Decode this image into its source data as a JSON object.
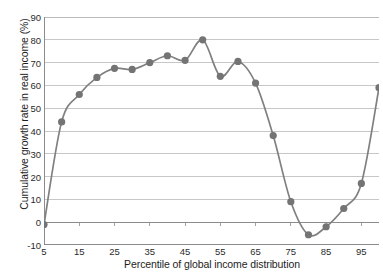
{
  "chart_data": {
    "type": "line",
    "title": "",
    "subtitle": "",
    "xlabel": "Percentile of global income distribution",
    "ylabel": "Cumulative growth rate in real income (%)",
    "xlim": [
      5,
      100
    ],
    "ylim": [
      -10,
      90
    ],
    "xticks": [
      5,
      15,
      25,
      35,
      45,
      55,
      65,
      75,
      85,
      95
    ],
    "xtick_labels": [
      "5",
      "15",
      "25",
      "35",
      "45",
      "55",
      "65",
      "75",
      "85",
      "95"
    ],
    "yticks": [
      -10,
      0,
      10,
      20,
      30,
      40,
      50,
      60,
      70,
      80,
      90
    ],
    "ytick_labels": [
      "-10",
      "0",
      "10",
      "20",
      "30",
      "40",
      "50",
      "60",
      "70",
      "80",
      "90"
    ],
    "grid": "horizontal",
    "legend": "none",
    "series": [
      {
        "name": "Cumulative growth rate in real income",
        "color": "#808080",
        "marker": "circle",
        "x": [
          5,
          10,
          15,
          20,
          25,
          30,
          35,
          40,
          45,
          50,
          55,
          60,
          65,
          70,
          75,
          80,
          85,
          90,
          95,
          100
        ],
        "values": [
          -1,
          44,
          56,
          63.5,
          67.5,
          67,
          70,
          73,
          71,
          80,
          64,
          70.5,
          61,
          38,
          9,
          -5.5,
          -2,
          6,
          17,
          59
        ],
        "points": [
          {
            "x": 5,
            "y": -1
          },
          {
            "x": 10,
            "y": 44
          },
          {
            "x": 15,
            "y": 56
          },
          {
            "x": 20,
            "y": 63.5
          },
          {
            "x": 25,
            "y": 67.5
          },
          {
            "x": 30,
            "y": 67
          },
          {
            "x": 35,
            "y": 70
          },
          {
            "x": 40,
            "y": 73
          },
          {
            "x": 45,
            "y": 71
          },
          {
            "x": 50,
            "y": 80
          },
          {
            "x": 55,
            "y": 64
          },
          {
            "x": 60,
            "y": 70.5
          },
          {
            "x": 65,
            "y": 61
          },
          {
            "x": 70,
            "y": 38
          },
          {
            "x": 75,
            "y": 9
          },
          {
            "x": 80,
            "y": -5.5
          },
          {
            "x": 85,
            "y": -2
          },
          {
            "x": 90,
            "y": 6
          },
          {
            "x": 95,
            "y": 17
          },
          {
            "x": 100,
            "y": 59
          }
        ]
      }
    ],
    "colors": {
      "line": "#808080",
      "marker": "#747474",
      "grid": "#b9b9b9",
      "axis": "#8c8c8c",
      "text": "#1d1d1d",
      "background": "#ffffff"
    }
  }
}
